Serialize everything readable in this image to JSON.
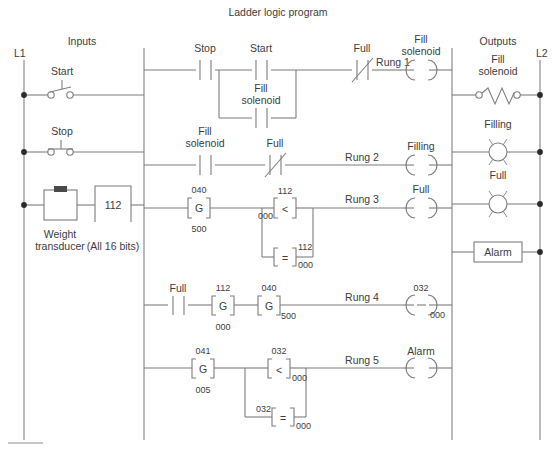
{
  "title": "Ladder logic program",
  "sections": {
    "inputs_label": "Inputs",
    "outputs_label": "Outputs",
    "left_rail_label": "L1",
    "right_rail_label": "L2"
  },
  "field_inputs": [
    {
      "name": "start-pushbutton",
      "label": "Start",
      "type": "normally-open-pushbutton"
    },
    {
      "name": "stop-pushbutton",
      "label": "Stop",
      "type": "normally-closed-pushbutton"
    },
    {
      "name": "weight-transducer",
      "label_line1": "Weight",
      "label_line2": "transducer",
      "type": "transducer-block"
    },
    {
      "name": "analog-input-word",
      "value": "112",
      "note": "(All 16 bits)",
      "type": "word-block"
    }
  ],
  "field_outputs": [
    {
      "name": "fill-solenoid-output",
      "label_line1": "Fill",
      "label_line2": "solenoid",
      "type": "solenoid-coil"
    },
    {
      "name": "filling-lamp-output",
      "label": "Filling",
      "type": "pilot-lamp"
    },
    {
      "name": "full-lamp-output",
      "label": "Full",
      "type": "pilot-lamp"
    },
    {
      "name": "alarm-output",
      "label": "Alarm",
      "type": "alarm-box"
    }
  ],
  "rungs": [
    {
      "id": "rung-1",
      "label": "Rung 1",
      "elements": [
        {
          "name": "stop-contact",
          "kind": "contact-no",
          "label": "Stop"
        },
        {
          "name": "start-contact",
          "kind": "contact-no",
          "label": "Start"
        },
        {
          "name": "fill-solenoid-seal-contact",
          "kind": "contact-no",
          "label_line1": "Fill",
          "label_line2": "solenoid",
          "branch": "parallel"
        },
        {
          "name": "full-contact",
          "kind": "contact-nc",
          "label": "Full"
        },
        {
          "name": "fill-solenoid-coil",
          "kind": "coil",
          "label_line1": "Fill",
          "label_line2": "solenoid"
        }
      ]
    },
    {
      "id": "rung-2",
      "label": "Rung 2",
      "elements": [
        {
          "name": "fill-solenoid-contact",
          "kind": "contact-no",
          "label_line1": "Fill",
          "label_line2": "solenoid"
        },
        {
          "name": "full-contact",
          "kind": "contact-nc",
          "label": "Full"
        },
        {
          "name": "filling-coil",
          "kind": "coil",
          "label": "Filling"
        }
      ]
    },
    {
      "id": "rung-3",
      "label": "Rung 3",
      "elements": [
        {
          "name": "get-block-040",
          "kind": "get",
          "glyph": "G",
          "top": "040",
          "bottom": "500"
        },
        {
          "name": "less-than-block",
          "kind": "compare",
          "glyph": "<",
          "top": "112",
          "left": "000",
          "branch": "parallel-top"
        },
        {
          "name": "equal-block",
          "kind": "compare",
          "glyph": "=",
          "top": "112",
          "bottom": "000",
          "branch": "parallel-bottom"
        },
        {
          "name": "full-coil",
          "kind": "coil",
          "label": "Full"
        }
      ]
    },
    {
      "id": "rung-4",
      "label": "Rung 4",
      "elements": [
        {
          "name": "full-contact",
          "kind": "contact-no",
          "label": "Full"
        },
        {
          "name": "get-block-112",
          "kind": "get",
          "glyph": "G",
          "top": "112",
          "bottom": "000"
        },
        {
          "name": "get-block-040",
          "kind": "get",
          "glyph": "G",
          "top": "040",
          "bottom_right": "500"
        },
        {
          "name": "output-coil-032",
          "kind": "coil-minus",
          "top": "032",
          "bottom_right": "000"
        }
      ]
    },
    {
      "id": "rung-5",
      "label": "Rung 5",
      "elements": [
        {
          "name": "get-block-041",
          "kind": "get",
          "glyph": "G",
          "top": "041",
          "bottom": "005"
        },
        {
          "name": "less-than-block",
          "kind": "compare",
          "glyph": "<",
          "top": "032",
          "bottom_right": "000",
          "branch": "parallel-top"
        },
        {
          "name": "equal-block",
          "kind": "compare",
          "glyph": "=",
          "left": "032",
          "bottom_right": "000",
          "branch": "parallel-bottom"
        },
        {
          "name": "alarm-coil",
          "kind": "coil",
          "label": "Alarm"
        }
      ]
    }
  ],
  "colors": {
    "line": "#7d7d7d",
    "text": "#3d3d3d",
    "node": "#2b2b2b",
    "background": "#ffffff"
  }
}
